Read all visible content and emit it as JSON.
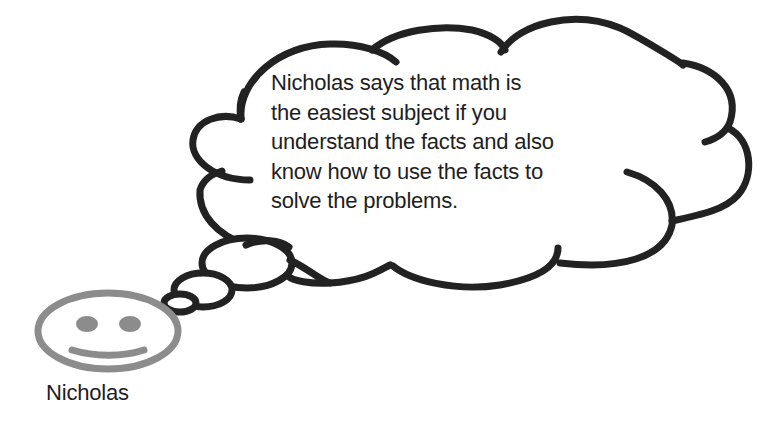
{
  "thought_bubble": {
    "speaker": "Nicholas",
    "lines": [
      "Nicholas says that math is",
      "the easiest subject if you",
      "understand the facts and also",
      "know how to use the facts to",
      "solve the problems."
    ],
    "outline_color": "#222222"
  },
  "character": {
    "name": "Nicholas",
    "icon": "smiley-face-icon",
    "face_color": "#8c8c8c"
  }
}
